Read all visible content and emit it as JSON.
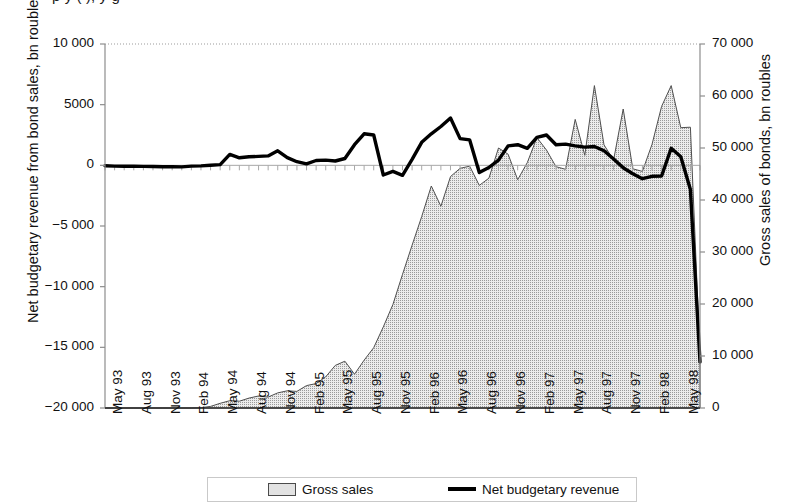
{
  "header": {
    "cut_off_text": "p                 y                                                    (                 ),            y                  g"
  },
  "axes": {
    "left": {
      "title": "Net budgetary revenue from bond sales, bn roubles",
      "ticks": [
        "10 000",
        "5000",
        "0",
        "−5 000",
        "−10 000",
        "−15 000",
        "−20 000"
      ],
      "tick_values": [
        10000,
        5000,
        0,
        -5000,
        -10000,
        -15000,
        -20000
      ],
      "min": -20000,
      "max": 10000
    },
    "right": {
      "title": "Gross sales of bonds, bn roubles",
      "ticks": [
        "70 000",
        "60 000",
        "50 000",
        "40 000",
        "30 000",
        "20 000",
        "10 000",
        "0"
      ],
      "tick_values": [
        70000,
        60000,
        50000,
        40000,
        30000,
        20000,
        10000,
        0
      ],
      "min": 0,
      "max": 70000
    },
    "x": {
      "ticks": [
        "May 93",
        "Aug 93",
        "Nov 93",
        "Feb 94",
        "May 94",
        "Aug 94",
        "Nov 94",
        "Feb 95",
        "May 95",
        "Aug 95",
        "Nov 95",
        "Feb 96",
        "May 96",
        "Aug 96",
        "Nov 96",
        "Feb 97",
        "May 97",
        "Aug 97",
        "Nov 97",
        "Feb 98",
        "May 98"
      ]
    }
  },
  "legend": {
    "items": [
      {
        "label": "Gross sales",
        "marker": "area-swatch",
        "color": "#e2e2e2"
      },
      {
        "label": "Net budgetary revenue",
        "marker": "line-swatch",
        "color": "#000000"
      }
    ]
  },
  "chart_data": {
    "type": "area",
    "title": "",
    "xlabel": "",
    "ylabel": "Net budgetary revenue from bond sales, bn roubles",
    "ylabel_secondary": "Gross sales of bonds, bn roubles",
    "ylim": [
      -20000,
      10000
    ],
    "ylim_secondary": [
      0,
      70000
    ],
    "grid": false,
    "legend_position": "bottom",
    "x": [
      "May 93",
      "Jun 93",
      "Jul 93",
      "Aug 93",
      "Sep 93",
      "Oct 93",
      "Nov 93",
      "Dec 93",
      "Jan 94",
      "Feb 94",
      "Mar 94",
      "Apr 94",
      "May 94",
      "Jun 94",
      "Jul 94",
      "Aug 94",
      "Sep 94",
      "Oct 94",
      "Nov 94",
      "Dec 94",
      "Jan 95",
      "Feb 95",
      "Mar 95",
      "Apr 95",
      "May 95",
      "Jun 95",
      "Jul 95",
      "Aug 95",
      "Sep 95",
      "Oct 95",
      "Nov 95",
      "Dec 95",
      "Jan 96",
      "Feb 96",
      "Mar 96",
      "Apr 96",
      "May 96",
      "Jun 96",
      "Jul 96",
      "Aug 96",
      "Sep 96",
      "Oct 96",
      "Nov 96",
      "Dec 96",
      "Jan 97",
      "Feb 97",
      "Mar 97",
      "Apr 97",
      "May 97",
      "Jun 97",
      "Jul 97",
      "Aug 97",
      "Sep 97",
      "Oct 97",
      "Nov 97",
      "Dec 97",
      "Jan 98",
      "Feb 98",
      "Mar 98",
      "Apr 98",
      "May 98",
      "Jun 98",
      "Jul 98"
    ],
    "series": [
      {
        "name": "Gross sales",
        "axis": "right",
        "type": "area",
        "unit": "bn roubles",
        "values": [
          0,
          0,
          0,
          0,
          0,
          0,
          0,
          0,
          0,
          0,
          60,
          300,
          900,
          1400,
          1300,
          1900,
          2300,
          2100,
          2900,
          3300,
          3200,
          4300,
          4700,
          6000,
          8200,
          9000,
          6500,
          9200,
          11600,
          15600,
          19900,
          25700,
          31300,
          36800,
          42700,
          38800,
          44500,
          46100,
          46500,
          42800,
          44200,
          50000,
          48800,
          43900,
          47200,
          52000,
          49600,
          46400,
          45900,
          55500,
          48600,
          62000,
          50600,
          47700,
          57500,
          46000,
          45500,
          50700,
          58000,
          62000,
          53900,
          54000,
          10200
        ]
      },
      {
        "name": "Net budgetary revenue",
        "axis": "left",
        "type": "line",
        "unit": "bn roubles",
        "values": [
          -40,
          -60,
          -70,
          -80,
          -90,
          -100,
          -110,
          -120,
          -130,
          -60,
          -50,
          0,
          60,
          900,
          620,
          700,
          740,
          780,
          1200,
          640,
          300,
          120,
          400,
          430,
          360,
          560,
          1700,
          2600,
          2500,
          -800,
          -500,
          -820,
          500,
          1900,
          2600,
          3200,
          3900,
          2200,
          2100,
          -600,
          -180,
          430,
          1600,
          1700,
          1400,
          2300,
          2500,
          1700,
          1750,
          1600,
          1500,
          1550,
          1200,
          520,
          -200,
          -700,
          -1100,
          -900,
          -880,
          1400,
          700,
          -2000,
          -16200
        ]
      }
    ]
  }
}
